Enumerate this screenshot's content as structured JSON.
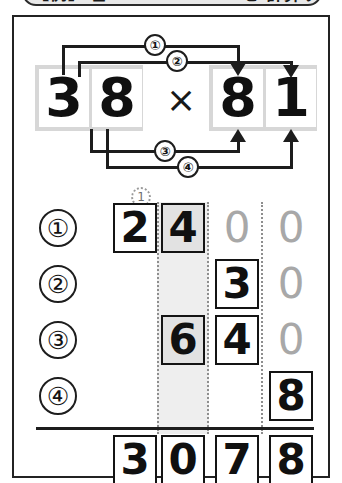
{
  "banner": {
    "text": "【例】 ◻ × 81 = 38 × 81 を 計算する"
  },
  "problem": {
    "multiplicand": "38",
    "multiplicand_digits": [
      "3",
      "8"
    ],
    "multiplier": "81",
    "multiplier_digits": [
      "8",
      "1"
    ],
    "operator": "×",
    "steps": [
      {
        "id": "1",
        "label": "①",
        "from": "3",
        "to": "8"
      },
      {
        "id": "2",
        "label": "②",
        "from": "3",
        "to": "1"
      },
      {
        "id": "3",
        "label": "③",
        "from": "8",
        "to": "8"
      },
      {
        "id": "4",
        "label": "④",
        "from": "8",
        "to": "1"
      }
    ]
  },
  "worksheet": {
    "column_count": 4,
    "highlight_column_index": 1,
    "carry_marker": {
      "value": "1",
      "column_index": 0
    },
    "rows": [
      {
        "label": "①",
        "cells": [
          {
            "value": "2",
            "style": "boxed"
          },
          {
            "value": "4",
            "style": "shaded"
          },
          {
            "value": "0",
            "style": "ghost"
          },
          {
            "value": "0",
            "style": "ghost"
          }
        ]
      },
      {
        "label": "②",
        "cells": [
          {
            "value": "",
            "style": "empty"
          },
          {
            "value": "",
            "style": "empty"
          },
          {
            "value": "3",
            "style": "boxed"
          },
          {
            "value": "0",
            "style": "ghost"
          }
        ]
      },
      {
        "label": "③",
        "cells": [
          {
            "value": "",
            "style": "empty"
          },
          {
            "value": "6",
            "style": "shaded"
          },
          {
            "value": "4",
            "style": "boxed"
          },
          {
            "value": "0",
            "style": "ghost"
          }
        ]
      },
      {
        "label": "④",
        "cells": [
          {
            "value": "",
            "style": "empty"
          },
          {
            "value": "",
            "style": "empty"
          },
          {
            "value": "",
            "style": "empty"
          },
          {
            "value": "8",
            "style": "boxed"
          }
        ]
      }
    ],
    "total": {
      "value": "3078",
      "cells": [
        {
          "value": "3",
          "style": "boxed"
        },
        {
          "value": "0",
          "style": "boxed"
        },
        {
          "value": "7",
          "style": "boxed"
        },
        {
          "value": "8",
          "style": "boxed"
        }
      ]
    }
  },
  "colors": {
    "ink": "#1d1d1d",
    "ghost": "#a8a8a8",
    "band": "#eeeeee",
    "shade": "#e2e2e2",
    "top_band": "#d7d7d7"
  }
}
